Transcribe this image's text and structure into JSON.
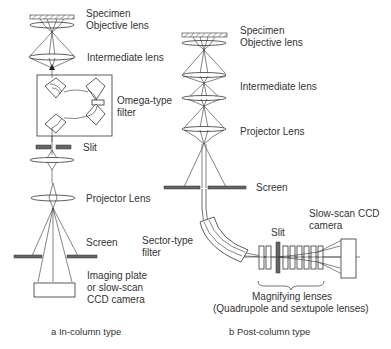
{
  "diagram": {
    "panel_a": {
      "caption": "a In-column type",
      "labels": {
        "specimen": "Specimen",
        "objective_lens": "Objective lens",
        "intermediate_lens": "Intermediate lens",
        "omega_filter_line1": "Omega-type",
        "omega_filter_line2": "filter",
        "slit": "Slit",
        "projector_lens": "Projector Lens",
        "screen": "Screen",
        "detector_line1": "Imaging plate",
        "detector_line2": "or slow-scan",
        "detector_line3": "CCD camera"
      }
    },
    "panel_b": {
      "caption": "b Post-column type",
      "labels": {
        "specimen": "Specimen",
        "objective_lens": "Objective lens",
        "intermediate_lens": "Intermediate lens",
        "projector_lens": "Projector Lens",
        "screen": "Screen",
        "sector_filter_line1": "Sector-type",
        "sector_filter_line2": "filter",
        "slit": "Slit",
        "camera_line1": "Slow-scan CCD",
        "camera_line2": "camera",
        "magnifying_line1": "Magnifying lenses",
        "magnifying_line2": "(Quadrupole and sextupole lenses)"
      }
    }
  }
}
